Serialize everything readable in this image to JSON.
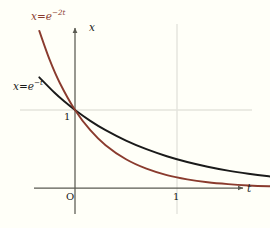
{
  "figure": {
    "background_color": "#fffff8",
    "labels": {
      "curve_fast": {
        "var": "x",
        "equals": "=",
        "base": "e",
        "exponent": "−2t",
        "color": "#8a3b2e"
      },
      "curve_slow": {
        "var": "x",
        "equals": "=",
        "base": "e",
        "exponent": "−t",
        "color": "#1a1a1a"
      },
      "axis_vertical": "x",
      "axis_horizontal": "t",
      "origin": "O",
      "tick_t_one": "1",
      "tick_x_one": "1"
    }
  },
  "chart_data": {
    "type": "line",
    "title": "",
    "xlabel": "t",
    "ylabel": "x",
    "xlim": [
      -0.35,
      2.3
    ],
    "ylim": [
      -0.22,
      2.05
    ],
    "grid": true,
    "grid_lines": {
      "vertical_at_x": [
        1
      ],
      "horizontal_at_y": [
        1
      ]
    },
    "grid_color": "#e2e2dc",
    "axis_color": "#5a5a52",
    "legend": "inline-annotations",
    "xticks": [
      0,
      1
    ],
    "xticklabels": [
      "O",
      "1"
    ],
    "yticks": [
      1
    ],
    "yticklabels": [
      "1"
    ],
    "series": [
      {
        "name": "x = e^{-t}",
        "color": "#1a1a1a",
        "linewidth": 1.9,
        "x": [
          -0.35,
          -0.2,
          -0.1,
          0,
          0.15,
          0.3,
          0.5,
          0.7,
          0.9,
          1.1,
          1.3,
          1.5,
          1.7,
          1.9,
          2.1,
          2.25
        ],
        "y": [
          1.419,
          1.221,
          1.105,
          1.0,
          0.861,
          0.741,
          0.607,
          0.497,
          0.407,
          0.333,
          0.273,
          0.223,
          0.183,
          0.15,
          0.122,
          0.105
        ]
      },
      {
        "name": "x = e^{-2t}",
        "color": "#8a3b2e",
        "linewidth": 1.9,
        "x": [
          -0.35,
          -0.25,
          -0.15,
          0,
          0.15,
          0.3,
          0.5,
          0.7,
          0.9,
          1.1,
          1.3,
          1.5,
          1.7,
          1.9,
          2.1,
          2.25
        ],
        "y": [
          2.014,
          1.649,
          1.35,
          1.0,
          0.741,
          0.549,
          0.368,
          0.247,
          0.165,
          0.111,
          0.074,
          0.05,
          0.033,
          0.022,
          0.015,
          0.011
        ]
      }
    ]
  }
}
